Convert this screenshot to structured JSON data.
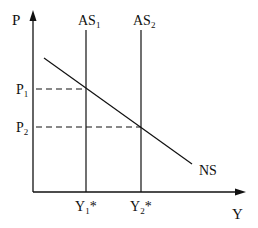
{
  "diagram": {
    "axes": {
      "y_label": "P",
      "x_label": "Y"
    },
    "curves": {
      "as1": {
        "label": "AS",
        "sub": "1"
      },
      "as2": {
        "label": "AS",
        "sub": "2"
      },
      "ns": {
        "label": "NS"
      }
    },
    "price_levels": {
      "p1": {
        "label": "P",
        "sub": "1"
      },
      "p2": {
        "label": "P",
        "sub": "2"
      }
    },
    "output_levels": {
      "y1": {
        "label": "Y",
        "sub": "1",
        "sup": "*"
      },
      "y2": {
        "label": "Y",
        "sub": "2",
        "sup": "*"
      }
    },
    "colors": {
      "line": "#111111",
      "background": "#ffffff"
    }
  }
}
